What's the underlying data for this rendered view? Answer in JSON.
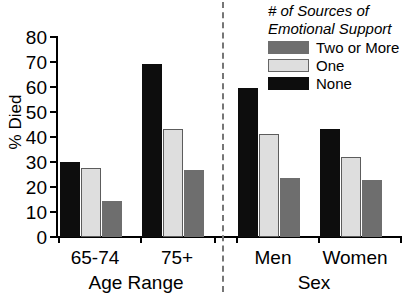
{
  "chart_data": {
    "type": "bar",
    "title": "",
    "xlabel": "",
    "ylabel": "% Died",
    "ylim": [
      0,
      80
    ],
    "yticks": [
      0,
      10,
      20,
      30,
      40,
      50,
      60,
      70,
      80
    ],
    "ytick_labels": [
      "0",
      "10",
      "20",
      "30",
      "40",
      "50",
      "60",
      "70",
      "80"
    ],
    "grid": false,
    "legend_position": "top-right",
    "legend_title": "# of Sources of Emotional Support",
    "categories": [
      "65-74",
      "75+",
      "Men",
      "Women"
    ],
    "section_labels": [
      "Age Range",
      "Sex"
    ],
    "series": [
      {
        "name": "None",
        "color": "#0d0d0d",
        "values": [
          30,
          69,
          59.5,
          43
        ]
      },
      {
        "name": "One",
        "color": "#dedede",
        "values": [
          27.5,
          43,
          41,
          32
        ]
      },
      {
        "name": "Two or More",
        "color": "#6e6e6e",
        "values": [
          14.5,
          26.5,
          23.5,
          22.5
        ]
      }
    ],
    "bar_order": [
      "None",
      "One",
      "Two or More"
    ]
  },
  "axis": {
    "y_title": "% Died",
    "ticks": [
      "80",
      "70",
      "60",
      "50",
      "40",
      "30",
      "20",
      "10",
      "0"
    ]
  },
  "categories": {
    "c0": "65-74",
    "c1": "75+",
    "c2": "Men",
    "c3": "Women"
  },
  "sections": {
    "s0": "Age Range",
    "s1": "Sex"
  },
  "legend": {
    "title_line1": "# of Sources of",
    "title_line2": "Emotional Support",
    "items": [
      {
        "label": "Two or More",
        "swatch": "two"
      },
      {
        "label": "One",
        "swatch": "one"
      },
      {
        "label": "None",
        "swatch": "none"
      }
    ]
  }
}
